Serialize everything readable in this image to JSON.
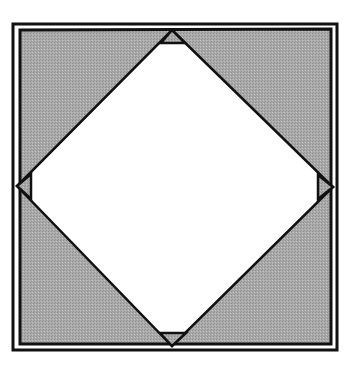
{
  "diagram": {
    "title": "Square with inscribed diamond and corner triangles",
    "colors": {
      "background": "#ffffff",
      "shade": "#a9a9a9",
      "stroke": "#111111"
    },
    "outer_frame": {
      "x": 13,
      "y": 24,
      "width": 324,
      "height": 326,
      "stroke_width": 3
    },
    "shaded_square": {
      "points": "20,30 331,29 331,344 20,344",
      "stroke_width": 3
    },
    "diamond": {
      "description": "white inscribed square rotated 45°",
      "points": "172,30 333,187 172,346 17,186",
      "stroke_width": 2.5
    },
    "corner_triangles": [
      {
        "name": "top",
        "points": "172,30 161,43 185,43"
      },
      {
        "name": "left",
        "points": "17,186 31,174 31,199"
      },
      {
        "name": "right",
        "points": "333,187 318,175 318,199"
      },
      {
        "name": "bottom",
        "points": "172,346 160,333 186,333"
      }
    ]
  }
}
